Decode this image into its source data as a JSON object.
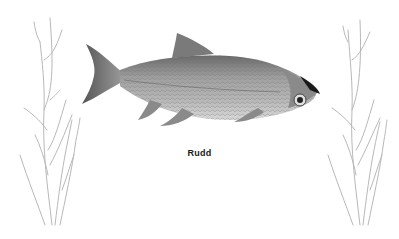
{
  "illustration": {
    "subject": "fish",
    "caption": "Rudd",
    "colors": {
      "background": "#ffffff",
      "fish_body": "#9a9a9a",
      "fish_dark": "#3a3a3a",
      "plant_stroke": "#b8b8b8",
      "caption": "#1a1a1a"
    }
  }
}
